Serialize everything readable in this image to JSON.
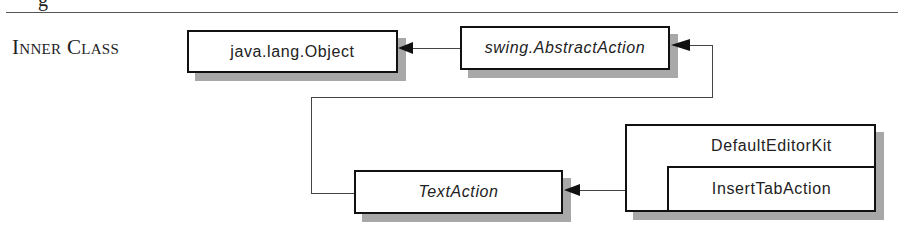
{
  "page": {
    "top_partial_glyph": "g",
    "section_label": "Inner Class"
  },
  "diagram": {
    "nodes": [
      {
        "id": "object",
        "label": "java.lang.Object",
        "italic": false
      },
      {
        "id": "abstract_action",
        "label": "swing.AbstractAction",
        "italic": true
      },
      {
        "id": "text_action",
        "label": "TextAction",
        "italic": true
      },
      {
        "id": "default_editor_kit",
        "label": "DefaultEditorKit",
        "italic": false
      },
      {
        "id": "insert_tab_action",
        "label": "InsertTabAction",
        "italic": false
      }
    ],
    "edges": [
      {
        "from": "swing.AbstractAction",
        "to": "java.lang.Object",
        "type": "extends"
      },
      {
        "from": "TextAction",
        "to": "swing.AbstractAction",
        "type": "extends"
      },
      {
        "from": "InsertTabAction",
        "to": "TextAction",
        "type": "extends"
      }
    ],
    "colors": {
      "border": "#111111",
      "shadow": "#a8a8a8",
      "line": "#444444"
    }
  }
}
